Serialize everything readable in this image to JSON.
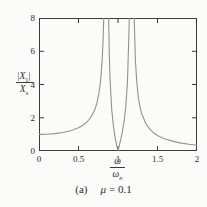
{
  "figure": {
    "caption": {
      "index": "(a)",
      "mu_symbol": "μ",
      "equals_value": "= 0.1"
    }
  },
  "chart_data": {
    "type": "line",
    "title": "",
    "xlabel": {
      "numerator": "ω",
      "denominator_base": "ω",
      "denominator_sub": "n",
      "plain": "ω/ωn"
    },
    "ylabel": {
      "numerator_open": "|",
      "numerator_base": "X",
      "numerator_sub": "1",
      "numerator_close": "|",
      "denominator_base": "X",
      "denominator_sub": "s",
      "plain": "|X1|/Xs"
    },
    "xlim": [
      0,
      2
    ],
    "ylim": [
      0,
      8
    ],
    "x_ticks": [
      0,
      0.5,
      1,
      1.5,
      2
    ],
    "x_tick_labels": [
      "0",
      "0.5",
      "1",
      "1.5",
      "2"
    ],
    "y_ticks": [
      0,
      2,
      4,
      6,
      8
    ],
    "y_tick_labels": [
      "0",
      "2",
      "4",
      "6",
      "8"
    ],
    "grid": false,
    "legend_position": "none",
    "mu": 0.1,
    "asymptotes_x": [
      0.854,
      1.171
    ],
    "zero_x": 1.0,
    "value_at_x0": 1.0,
    "series": [
      {
        "name": "mu = 0.1",
        "points": [
          [
            0.0,
            1.0
          ],
          [
            0.1,
            1.011
          ],
          [
            0.2,
            1.046
          ],
          [
            0.3,
            1.111
          ],
          [
            0.4,
            1.218
          ],
          [
            0.5,
            1.395
          ],
          [
            0.55,
            1.529
          ],
          [
            0.6,
            1.713
          ],
          [
            0.65,
            1.983
          ],
          [
            0.7,
            2.416
          ],
          [
            0.73,
            2.833
          ],
          [
            0.76,
            3.501
          ],
          [
            0.78,
            4.233
          ],
          [
            0.8,
            5.488
          ],
          [
            0.81,
            6.531
          ],
          [
            0.82,
            8.174
          ],
          [
            0.825,
            9.411
          ],
          [
            0.83,
            11.15
          ],
          [
            0.84,
            18.27
          ],
          [
            0.86,
            42.33
          ],
          [
            0.87,
            14.65
          ],
          [
            0.88,
            8.499
          ],
          [
            0.89,
            5.777
          ],
          [
            0.9,
            4.232
          ],
          [
            0.92,
            2.516
          ],
          [
            0.94,
            1.556
          ],
          [
            0.96,
            0.912
          ],
          [
            0.98,
            0.419
          ],
          [
            1.0,
            0.0
          ],
          [
            1.02,
            0.394
          ],
          [
            1.04,
            0.804
          ],
          [
            1.06,
            1.273
          ],
          [
            1.08,
            1.871
          ],
          [
            1.1,
            2.731
          ],
          [
            1.12,
            4.19
          ],
          [
            1.14,
            7.453
          ],
          [
            1.15,
            11.42
          ],
          [
            1.16,
            22.86
          ],
          [
            1.18,
            26.63
          ],
          [
            1.19,
            13.2
          ],
          [
            1.2,
            8.871
          ],
          [
            1.22,
            5.445
          ],
          [
            1.24,
            3.975
          ],
          [
            1.26,
            3.15
          ],
          [
            1.28,
            2.619
          ],
          [
            1.3,
            2.247
          ],
          [
            1.35,
            1.664
          ],
          [
            1.4,
            1.323
          ],
          [
            1.45,
            1.097
          ],
          [
            1.5,
            0.935
          ],
          [
            1.55,
            0.812
          ],
          [
            1.6,
            0.716
          ],
          [
            1.7,
            0.576
          ],
          [
            1.8,
            0.477
          ],
          [
            1.9,
            0.405
          ],
          [
            2.0,
            0.349
          ]
        ]
      }
    ],
    "colors": {
      "curve": "#8f9391",
      "axis": "#3b3b3b",
      "text": "#2c2c2c",
      "background": "#fbfbf9"
    }
  }
}
